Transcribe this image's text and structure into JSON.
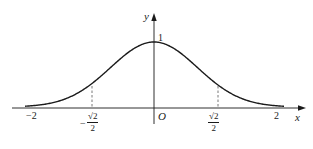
{
  "chart_data": {
    "type": "line",
    "title": "",
    "function": "y = e^(-x^2) (bell-shaped curve)",
    "xlabel": "x",
    "ylabel": "y",
    "origin_label": "O",
    "x_tick_labels": [
      "-2",
      "-√2/2",
      "√2/2",
      "2"
    ],
    "y_tick_labels": [
      "1"
    ],
    "xlim": [
      -2,
      2
    ],
    "ylim": [
      0,
      1
    ],
    "grid": false,
    "legend": "none",
    "x": [
      -2,
      -1.5,
      -1,
      -0.7071,
      -0.5,
      0,
      0.5,
      0.7071,
      1,
      1.5,
      2
    ],
    "values": [
      0.02,
      0.11,
      0.37,
      0.61,
      0.78,
      1,
      0.78,
      0.61,
      0.37,
      0.11,
      0.02
    ],
    "annotations": [
      {
        "type": "dashed-vertical",
        "x": -0.7071,
        "label": "-√2/2"
      },
      {
        "type": "dashed-vertical",
        "x": 0.7071,
        "label": "√2/2"
      }
    ]
  },
  "labels": {
    "y_axis": "y",
    "x_axis": "x",
    "origin": "O",
    "y_one": "1",
    "x_neg_two": "−2",
    "x_pos_two": "2",
    "neg_sign": "−",
    "sqrt2": "√2",
    "two": "2"
  },
  "colors": {
    "line": "#1a1a1a",
    "axis": "#1a1a1a",
    "dashed": "#555555",
    "background": "#ffffff"
  }
}
